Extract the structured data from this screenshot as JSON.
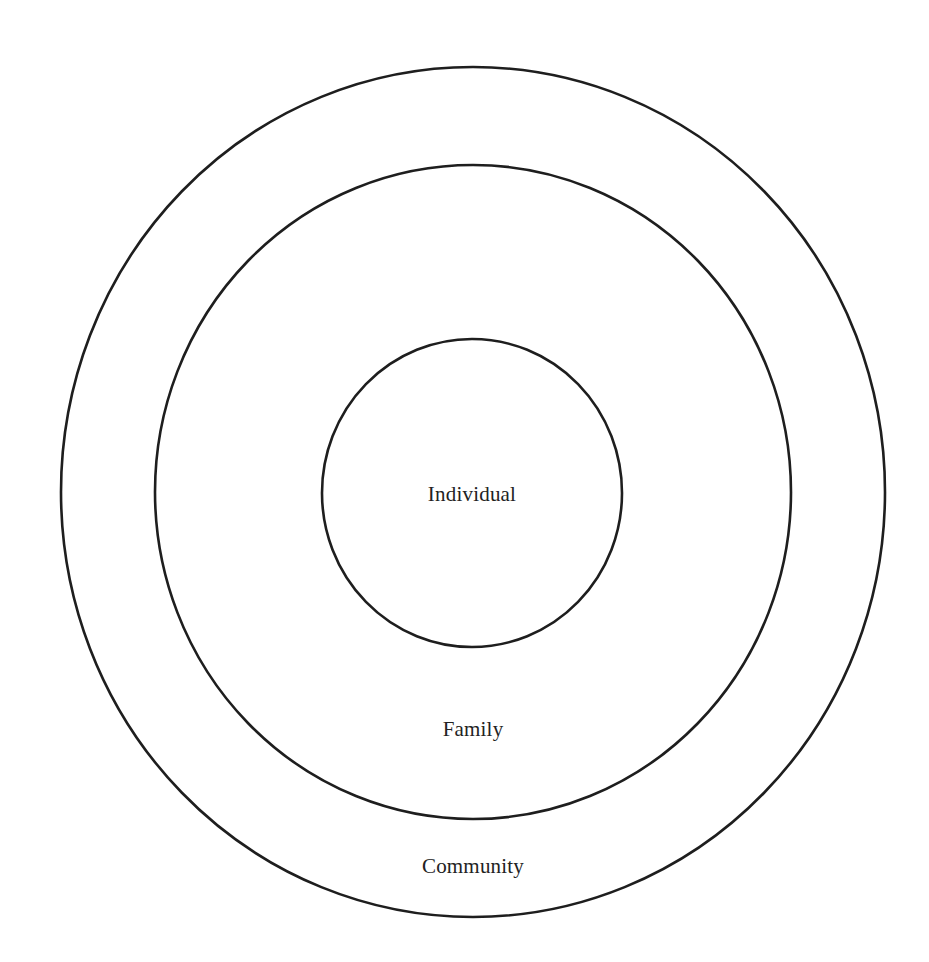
{
  "diagram": {
    "type": "concentric-circles",
    "stroke_color": "#1e1e1e",
    "text_color": "#222222",
    "background": "#ffffff",
    "circles": [
      {
        "name": "community",
        "label": "Community",
        "cx": 473,
        "cy": 492,
        "rx": 412,
        "ry": 425,
        "label_x": 473,
        "label_y": 866
      },
      {
        "name": "family",
        "label": "Family",
        "cx": 473,
        "cy": 492,
        "rx": 318,
        "ry": 327,
        "label_x": 473,
        "label_y": 729
      },
      {
        "name": "individual",
        "label": "Individual",
        "cx": 472,
        "cy": 493,
        "rx": 150,
        "ry": 154,
        "label_x": 472,
        "label_y": 494
      }
    ]
  }
}
